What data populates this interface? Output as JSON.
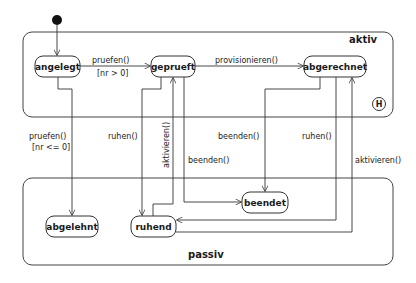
{
  "diagram": {
    "type": "uml-state-machine",
    "regions": {
      "aktiv": {
        "label": "aktiv",
        "history_marker": "H"
      },
      "passiv": {
        "label": "passiv"
      }
    },
    "states": {
      "angelegt": "angelegt",
      "geprueft": "geprueft",
      "abgerechnet": "abgerechnet",
      "abgelehnt": "abgelehnt",
      "ruhend": "ruhend",
      "beendet": "beendet"
    },
    "transitions": {
      "angelegt_geprueft": {
        "event": "pruefen()",
        "guard": "[nr > 0]"
      },
      "geprueft_abgerechnet": {
        "event": "provisionieren()"
      },
      "angelegt_abgelehnt": {
        "event": "pruefen()",
        "guard": "[nr <= 0]"
      },
      "geprueft_ruhend": {
        "event": "ruhen()"
      },
      "ruhend_geprueft": {
        "event": "aktivieren()"
      },
      "geprueft_beendet": {
        "event": "beenden()"
      },
      "abgerechnet_beendet": {
        "event": "beenden()"
      },
      "abgerechnet_ruhend": {
        "event": "ruhen()"
      },
      "ruhend_abgerechnet": {
        "event": "aktivieren()"
      }
    },
    "colors": {
      "stroke": "#333333",
      "background": "#ffffff",
      "text": "#1a1a1a"
    }
  }
}
